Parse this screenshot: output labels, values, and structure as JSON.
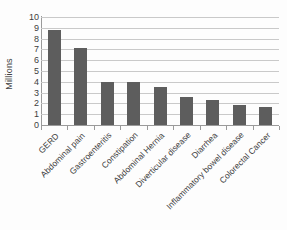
{
  "chart_data": {
    "type": "bar",
    "title": "",
    "subtitle": "",
    "xlabel": "",
    "ylabel": "Millions",
    "ylim": [
      0,
      10
    ],
    "ytick_step": 1,
    "yticks": [
      "10",
      "9",
      "8",
      "7",
      "6",
      "5",
      "4",
      "3",
      "2",
      "1",
      "0"
    ],
    "grid": true,
    "grid_axis": "y",
    "legend": "none",
    "orientation": "vertical",
    "categories": [
      "GERD",
      "Abdominal pain",
      "Gastroenteritis",
      "Constipation",
      "Abdominal Hernia",
      "Diverticular disease",
      "Diarrhea",
      "Inflammatory bowel disease",
      "Colorectal Cancer"
    ],
    "values": [
      8.8,
      7.1,
      3.95,
      3.95,
      3.5,
      2.6,
      2.35,
      1.85,
      1.7
    ],
    "series": [
      {
        "name": "Visits",
        "values": [
          8.8,
          7.1,
          3.95,
          3.95,
          3.5,
          2.6,
          2.35,
          1.85,
          1.7
        ]
      }
    ],
    "bar_color": "#5d5d5d",
    "grid_color": "#c9c9c9",
    "axis_color": "#9a9a9a",
    "background": "#fdfdfd",
    "xtick_label_rotation": -45
  }
}
